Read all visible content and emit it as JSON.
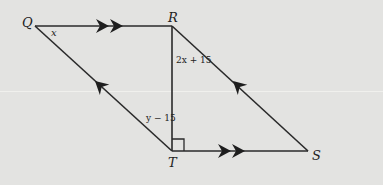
{
  "diagram": {
    "type": "parallelogram",
    "vertices": {
      "Q": {
        "label": "Q",
        "x": 35,
        "y": 26
      },
      "R": {
        "label": "R",
        "x": 172,
        "y": 26
      },
      "S": {
        "label": "S",
        "x": 308,
        "y": 151
      },
      "T": {
        "label": "T",
        "x": 172,
        "y": 151
      }
    },
    "segments": [
      {
        "id": "QR",
        "marks": "double-arrow",
        "direction": "Q->R"
      },
      {
        "id": "TS",
        "marks": "double-arrow",
        "direction": "T->S"
      },
      {
        "id": "TQ",
        "marks": "single-arrow",
        "direction": "T->Q"
      },
      {
        "id": "SR",
        "marks": "single-arrow",
        "direction": "S->R"
      },
      {
        "id": "RT",
        "marks": "none",
        "note": "altitude, perpendicular to TS"
      }
    ],
    "angle_labels": {
      "at_Q": "x",
      "at_R_between_RT_and_RS": "2x + 15",
      "at_T_between_TQ_and_TR": "y − 15"
    },
    "right_angle_at": "T",
    "colors": {
      "background": "#e3e3e1",
      "stroke": "#2a2a2a"
    }
  }
}
